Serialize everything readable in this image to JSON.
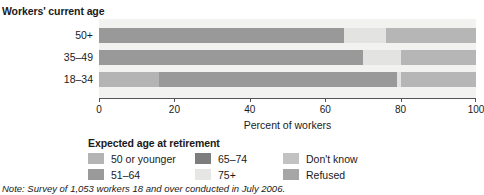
{
  "chart_data": {
    "type": "bar",
    "orientation": "horizontal",
    "stacked": true,
    "title": "",
    "ylabel": "Workers' current age",
    "xlabel": "Percent of workers",
    "categories": [
      "50+",
      "35–49",
      "18–34"
    ],
    "xlim": [
      0,
      100
    ],
    "xticks": [
      0,
      20,
      40,
      60,
      80,
      100
    ],
    "xticklabels": [
      "0",
      "20",
      "40",
      "60",
      "80",
      "100"
    ],
    "grid": false,
    "legend_title": "Expected age at retirement",
    "legend_position": "bottom",
    "series": [
      {
        "name": "50 or younger",
        "color": "#b4b4b4",
        "values": [
          0,
          0,
          16
        ]
      },
      {
        "name": "51–64",
        "color": "#999999",
        "values": [
          65,
          70,
          63
        ]
      },
      {
        "name": "65–74",
        "color": "#7d7d7d",
        "values": [
          0,
          0,
          0
        ]
      },
      {
        "name": "75+",
        "color": "#e3e3e1",
        "values": [
          11,
          10,
          1
        ]
      },
      {
        "name": "Don't know",
        "color": "#c0c0c0",
        "values": [
          24,
          20,
          20
        ]
      },
      {
        "name": "Refused",
        "color": "#a8a8a8",
        "values": [
          0,
          0,
          0
        ]
      }
    ],
    "bars": [
      {
        "category": "50+",
        "segments": [
          {
            "series": "51–64",
            "start": 0,
            "end": 65,
            "value": 65,
            "color": "#999999"
          },
          {
            "series": "75+",
            "start": 65,
            "end": 76,
            "value": 11,
            "color": "#e3e3e1"
          },
          {
            "series": "Don't know",
            "start": 76,
            "end": 100,
            "value": 24,
            "color": "#b6b6b6"
          }
        ]
      },
      {
        "category": "35–49",
        "segments": [
          {
            "series": "51–64",
            "start": 0,
            "end": 70,
            "value": 70,
            "color": "#999999"
          },
          {
            "series": "75+",
            "start": 70,
            "end": 80,
            "value": 10,
            "color": "#e3e3e1"
          },
          {
            "series": "Don't know",
            "start": 80,
            "end": 100,
            "value": 20,
            "color": "#b6b6b6"
          }
        ]
      },
      {
        "category": "18–34",
        "segments": [
          {
            "series": "50 or younger",
            "start": 0,
            "end": 16,
            "value": 16,
            "color": "#b4b4b4"
          },
          {
            "series": "51–64",
            "start": 16,
            "end": 79,
            "value": 63,
            "color": "#999999"
          },
          {
            "series": "75+",
            "start": 79,
            "end": 80,
            "value": 1,
            "color": "#e3e3e1"
          },
          {
            "series": "Don't know",
            "start": 80,
            "end": 100,
            "value": 20,
            "color": "#b6b6b6"
          }
        ]
      }
    ],
    "plot_background": "#f2f2f0"
  },
  "legend": {
    "title": "Expected age at retirement",
    "items": [
      {
        "label": "50 or younger",
        "color": "#b4b4b4",
        "col": 0,
        "row": 0
      },
      {
        "label": "51–64",
        "color": "#9a9a9a",
        "col": 0,
        "row": 1
      },
      {
        "label": "65–74",
        "color": "#7d7d7d",
        "col": 1,
        "row": 0
      },
      {
        "label": "75+",
        "color": "#e6e6e4",
        "col": 1,
        "row": 1
      },
      {
        "label": "Don't know",
        "color": "#c2c2c2",
        "col": 2,
        "row": 0
      },
      {
        "label": "Refused",
        "color": "#a6a6a6",
        "col": 2,
        "row": 1
      }
    ]
  },
  "note": {
    "prefix": "Note:",
    "text": " Survey of 1,053 workers 18 and over conducted in July 2006."
  }
}
